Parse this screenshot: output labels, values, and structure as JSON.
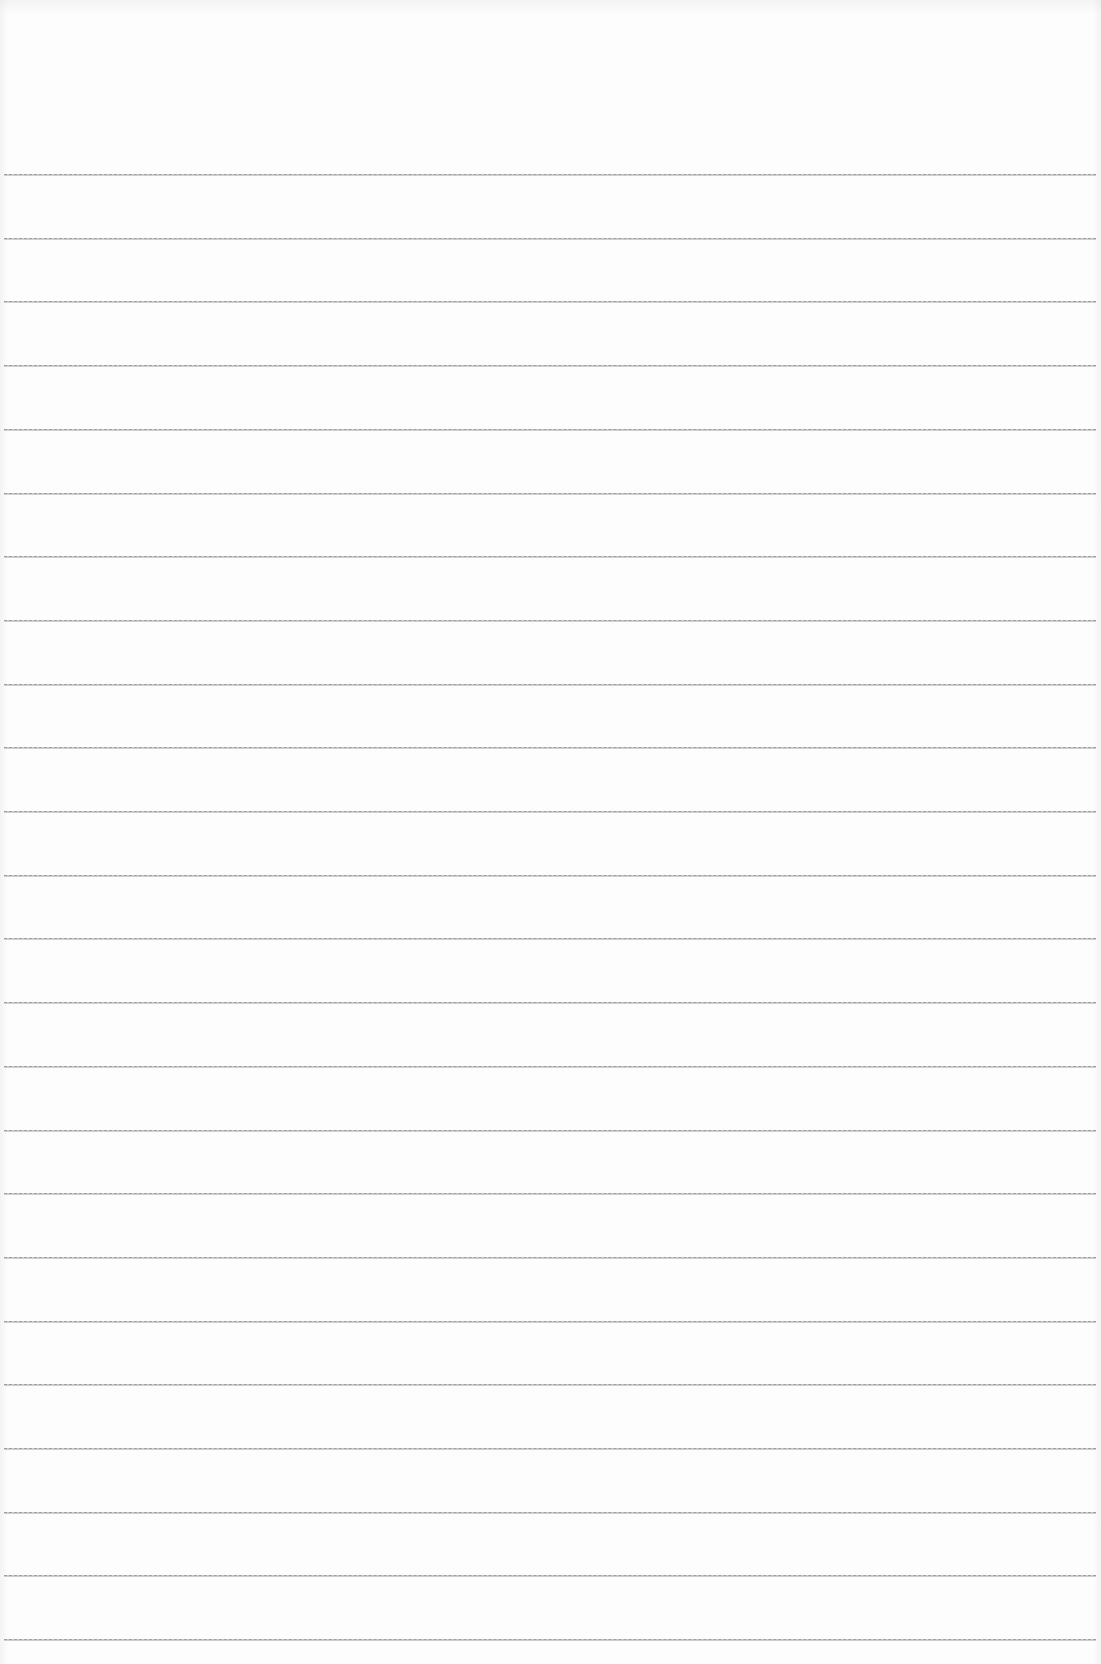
{
  "page": {
    "type": "ruled-notebook-paper",
    "background_color": "#fdfdfd",
    "rule_color": "#8a8a8a",
    "rule_count": 24,
    "first_rule_y": 174,
    "rule_spacing": 63.7,
    "rule_left": 4,
    "rule_width": 1092,
    "text_content": []
  }
}
